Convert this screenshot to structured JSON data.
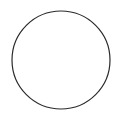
{
  "figure": {
    "type": "geometric-shape",
    "canvas": {
      "width": 120,
      "height": 122,
      "background_color": "#ffffff"
    },
    "shapes": [
      {
        "name": "circle",
        "label": "Circle",
        "center_x": 61,
        "center_y": 60,
        "radius": 49,
        "diameter": 98,
        "stroke_color": "#2a2a2a",
        "stroke_width": 1.2,
        "fill": "none",
        "bounds": {
          "left": 12,
          "top": 11,
          "right": 110,
          "bottom": 109
        }
      }
    ],
    "text_labels": []
  }
}
